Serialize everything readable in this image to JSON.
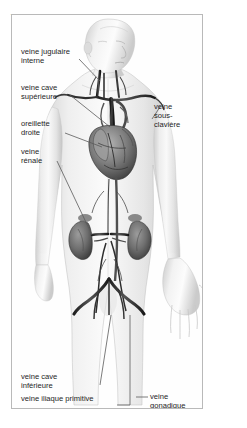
{
  "figure": {
    "title": "VEINES CAVES",
    "language": "fr",
    "background_color": "#ffffff",
    "frame_border_color": "#b9b9b9",
    "text_color": "#1d1d1d",
    "vessel_color": "#2a2a2a",
    "skin_color": "#e9e9e9",
    "organ_color": "#8a8a8a"
  },
  "labels": {
    "left": [
      {
        "id": "jugulaire",
        "line1": "veine jugulaire",
        "line2": "interne"
      },
      {
        "id": "cave-superieure",
        "line1": "veine cave",
        "line2": "supérieure"
      },
      {
        "id": "oreillette",
        "line1": "oreillette",
        "line2": "droite"
      },
      {
        "id": "renale",
        "line1": "veine",
        "line2": "rénale"
      }
    ],
    "right": [
      {
        "id": "sous-claviere",
        "line1": "veine",
        "line2": "sous-",
        "line3": "clavière"
      }
    ],
    "bottom_left": [
      {
        "id": "cave-inferieure",
        "line1": "veine cave",
        "line2": "inférieure"
      },
      {
        "id": "iliaque",
        "line1": "veine iliaque primitive"
      }
    ],
    "bottom_right": [
      {
        "id": "gonadique",
        "line1": "veine",
        "line2": "gonadique"
      }
    ]
  },
  "anatomy_parts": [
    "head",
    "neck",
    "right shoulder",
    "left shoulder",
    "thorax",
    "heart",
    "right atrium",
    "superior vena cava",
    "inferior vena cava",
    "internal jugular vein",
    "subclavian vein",
    "renal vein",
    "right kidney",
    "left kidney",
    "common iliac vein",
    "gonadal vein",
    "abdomen",
    "pelvis",
    "right arm",
    "left arm",
    "open left hand",
    "thighs"
  ]
}
